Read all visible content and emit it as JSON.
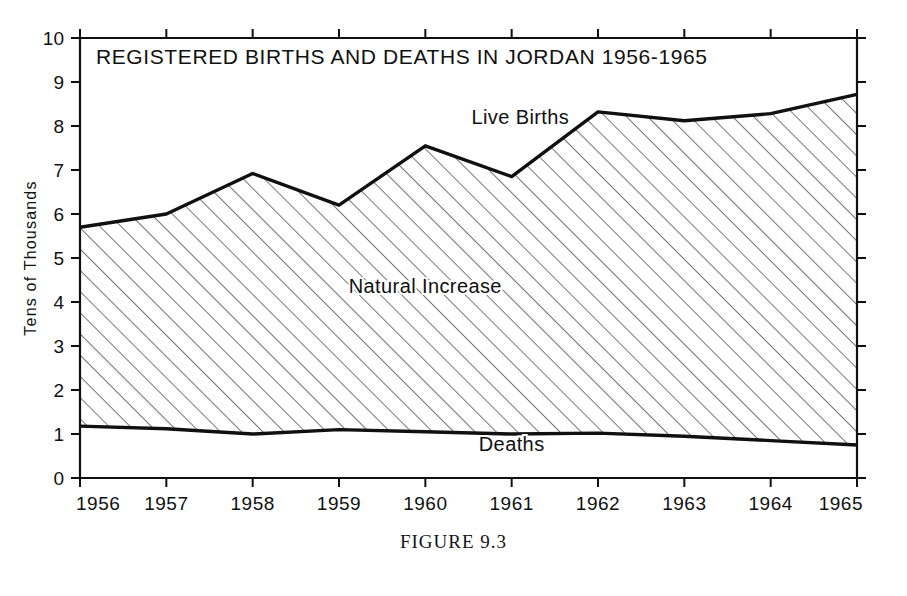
{
  "figure": {
    "caption_label": "FIGURE",
    "caption_number": "9.3"
  },
  "chart_data": {
    "type": "area",
    "title": "REGISTERED BIRTHS AND DEATHS IN JORDAN 1956-1965",
    "xlabel": "",
    "ylabel": "Tens of Thousands",
    "xlim": [
      1956,
      1965
    ],
    "ylim": [
      0,
      10
    ],
    "grid": false,
    "legend_position": "inline-annotations",
    "x": [
      1956,
      1957,
      1958,
      1959,
      1960,
      1961,
      1962,
      1963,
      1964,
      1965
    ],
    "categories": [
      "1956",
      "1957",
      "1958",
      "1959",
      "1960",
      "1961",
      "1962",
      "1963",
      "1964",
      "1965"
    ],
    "y_ticks": [
      "0",
      "1",
      "2",
      "3",
      "4",
      "5",
      "6",
      "7",
      "8",
      "9",
      "10"
    ],
    "series": [
      {
        "name": "Live Births",
        "values": [
          5.7,
          6.0,
          6.92,
          6.2,
          7.55,
          6.85,
          8.32,
          8.12,
          8.28,
          8.72
        ]
      },
      {
        "name": "Deaths",
        "values": [
          1.18,
          1.12,
          1.0,
          1.1,
          1.05,
          1.0,
          1.02,
          0.95,
          0.85,
          0.75
        ]
      }
    ],
    "annotations": [
      {
        "text": "Live Births",
        "x": 1961.1,
        "y": 8.05
      },
      {
        "text": "Natural Increase",
        "x": 1960.0,
        "y": 4.2
      },
      {
        "text": "Deaths",
        "x": 1961.0,
        "y": 0.62
      }
    ],
    "fill_label": "Natural Increase",
    "colors": {
      "line": "#101010",
      "hatch": "#2b2b2b",
      "axis": "#101010",
      "background": "#ffffff"
    }
  }
}
